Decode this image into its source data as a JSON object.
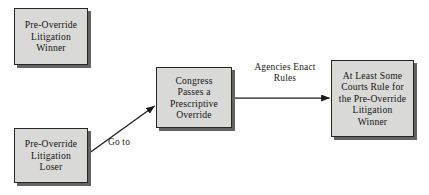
{
  "diagram": {
    "type": "flowchart",
    "nodes": [
      {
        "id": "pre-override-litigation-winner",
        "label": "Pre-Override\nLitigation\nWinner"
      },
      {
        "id": "pre-override-litigation-loser",
        "label": "Pre-Override\nLitigation\nLoser"
      },
      {
        "id": "congress-passes-prescriptive-override",
        "label": "Congress\nPasses a\nPrescriptive\nOverride"
      },
      {
        "id": "courts-rule-for-pre-override-litigation-winner",
        "label": "At Least Some\nCourts Rule for\nthe Pre-Override\nLitigation\nWinner"
      }
    ],
    "edges": [
      {
        "id": "loser-to-congress",
        "label": "Go to",
        "from": "pre-override-litigation-loser",
        "to": "congress-passes-prescriptive-override"
      },
      {
        "id": "congress-to-courts",
        "label": "Agencies Enact\nRules",
        "from": "congress-passes-prescriptive-override",
        "to": "courts-rule-for-pre-override-litigation-winner"
      }
    ],
    "colors": {
      "box_fill": "#d9d9d7",
      "box_border": "#262626",
      "box_shadow": "#636363",
      "text": "#151515",
      "arrow": "#1a1a1a",
      "background": "#ffffff"
    }
  }
}
